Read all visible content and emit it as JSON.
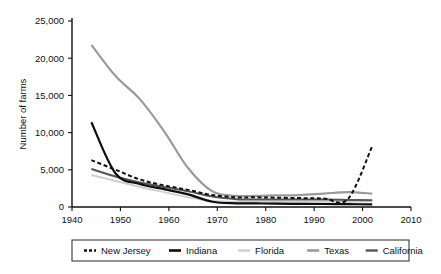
{
  "chart_data": {
    "type": "line",
    "title": "",
    "xlabel": "",
    "ylabel": "Number of farms",
    "xlim": [
      1940,
      2010
    ],
    "ylim": [
      0,
      25000
    ],
    "xticks": [
      1940,
      1950,
      1960,
      1970,
      1980,
      1990,
      2000,
      2010
    ],
    "xtick_labels": [
      "1940",
      "1950",
      "1960",
      "1970",
      "1980",
      "1990",
      "2000",
      "2010"
    ],
    "yticks": [
      0,
      5000,
      10000,
      15000,
      20000,
      25000
    ],
    "ytick_labels": [
      "0",
      "5,000",
      "10,000",
      "15,000",
      "20,000",
      "25,000"
    ],
    "grid": false,
    "legend_position": "bottom",
    "series": [
      {
        "name": "New Jersey",
        "color": "#111111",
        "style": "dashed",
        "width": 2.0,
        "x": [
          1944,
          1949,
          1954,
          1959,
          1964,
          1969,
          1974,
          1978,
          1982,
          1987,
          1992,
          1997,
          2002
        ],
        "values": [
          6300,
          5000,
          3700,
          2900,
          2300,
          1600,
          1300,
          1300,
          1250,
          1200,
          1150,
          1100,
          8200
        ]
      },
      {
        "name": "Indiana",
        "color": "#0d0d0d",
        "style": "solid",
        "width": 2.2,
        "x": [
          1944,
          1949,
          1954,
          1959,
          1964,
          1969,
          1974,
          1978,
          1982,
          1987,
          1992,
          1997,
          2002
        ],
        "values": [
          11400,
          4500,
          3100,
          2400,
          1700,
          700,
          500,
          480,
          450,
          420,
          400,
          380,
          360
        ]
      },
      {
        "name": "Florida",
        "color": "#cfcfcf",
        "style": "solid",
        "width": 2.0,
        "x": [
          1944,
          1949,
          1954,
          1959,
          1964,
          1969,
          1974,
          1978,
          1982,
          1987,
          1992,
          1997,
          2002
        ],
        "values": [
          4300,
          3500,
          2700,
          2000,
          1300,
          800,
          700,
          700,
          700,
          700,
          700,
          700,
          800
        ]
      },
      {
        "name": "Texas",
        "color": "#9a9a9a",
        "style": "solid",
        "width": 2.2,
        "x": [
          1944,
          1949,
          1954,
          1959,
          1964,
          1969,
          1974,
          1978,
          1982,
          1987,
          1992,
          1997,
          2002
        ],
        "values": [
          21800,
          17600,
          14500,
          10200,
          5200,
          2100,
          1500,
          1500,
          1550,
          1600,
          1800,
          2000,
          1800
        ]
      },
      {
        "name": "California",
        "color": "#555555",
        "style": "solid",
        "width": 2.0,
        "x": [
          1944,
          1949,
          1954,
          1959,
          1964,
          1969,
          1974,
          1978,
          1982,
          1987,
          1992,
          1997,
          2002
        ],
        "values": [
          5100,
          4100,
          3300,
          2700,
          2100,
          1400,
          1050,
          1000,
          1000,
          1000,
          1000,
          950,
          900
        ]
      }
    ]
  },
  "legend": {
    "entries": [
      {
        "label": "New Jersey",
        "swatch": "dashed-line-swatch"
      },
      {
        "label": "Indiana",
        "swatch": "solid-line-swatch"
      },
      {
        "label": "Florida",
        "swatch": "solid-line-swatch"
      },
      {
        "label": "Texas",
        "swatch": "solid-line-swatch"
      },
      {
        "label": "California",
        "swatch": "solid-line-swatch"
      }
    ]
  }
}
